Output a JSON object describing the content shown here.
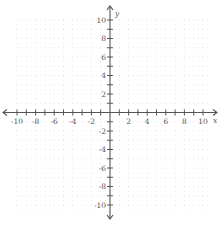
{
  "diagram": {
    "type": "cartesian-coordinate-plane",
    "x_axis": {
      "label": "x",
      "min": -10,
      "max": 10,
      "tick_step": 1,
      "label_step": 2,
      "tick_labels": [
        "-10",
        "-8",
        "-6",
        "-4",
        "-2",
        "2",
        "4",
        "6",
        "8",
        "10"
      ]
    },
    "y_axis": {
      "label": "y",
      "min": -10,
      "max": 10,
      "tick_step": 1,
      "label_step": 2,
      "tick_labels": [
        "10",
        "8",
        "6",
        "4",
        "2",
        "-2",
        "-4",
        "-6",
        "-8",
        "-10"
      ]
    },
    "grid": {
      "style": "dotted",
      "color": "#cfcfcf"
    },
    "axis_color": "#555555"
  }
}
